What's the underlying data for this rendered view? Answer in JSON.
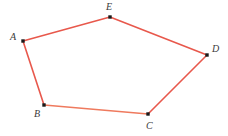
{
  "figure": {
    "kind": "polygon-diagram",
    "shape_name": "pentagon",
    "width": 228,
    "height": 136,
    "background_color": "#ffffff",
    "edge_color": "#e8584c",
    "edge_color_alt": "#ef7a5e",
    "edge_width": 1.6,
    "vertex_color": "#1a1a1a",
    "vertex_size": 3.4,
    "label_color": "#3a3a3a",
    "label_font_size": 10,
    "vertices": [
      {
        "label": "A",
        "x": 23,
        "y": 41,
        "label_x": 10,
        "label_y": 32
      },
      {
        "label": "E",
        "x": 110,
        "y": 17,
        "label_x": 106,
        "label_y": 2
      },
      {
        "label": "D",
        "x": 207,
        "y": 55,
        "label_x": 212,
        "label_y": 44
      },
      {
        "label": "C",
        "x": 148,
        "y": 114,
        "label_x": 146,
        "label_y": 121
      },
      {
        "label": "B",
        "x": 44,
        "y": 105,
        "label_x": 34,
        "label_y": 109
      }
    ],
    "edges": [
      {
        "name": "edge-A-E",
        "from": "A",
        "to": "E",
        "color": "#e8584c"
      },
      {
        "name": "edge-E-D",
        "from": "E",
        "to": "D",
        "color": "#e8584c"
      },
      {
        "name": "edge-D-C",
        "from": "D",
        "to": "C",
        "color": "#e8584c"
      },
      {
        "name": "edge-C-B",
        "from": "C",
        "to": "B",
        "color": "#ef7a5e"
      },
      {
        "name": "edge-B-A",
        "from": "B",
        "to": "A",
        "color": "#e8584c"
      }
    ]
  }
}
